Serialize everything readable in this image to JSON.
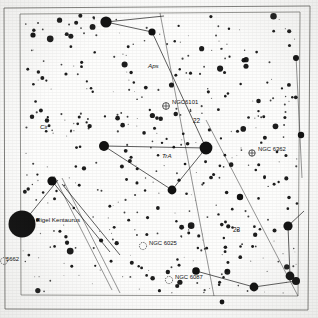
{
  "figure": {
    "kind": "star-chart",
    "background_color": "#fdfdfc",
    "ink_color": "#111111",
    "frame_color": "#5a5a55"
  },
  "frame": {
    "outer": {
      "x": 4,
      "y": 6,
      "w": 306,
      "h": 304
    },
    "inner": {
      "x": 20,
      "y": 12,
      "w": 280,
      "h": 284
    }
  },
  "constellation_labels": [
    {
      "name": "Aps",
      "text": "Aps",
      "x": 148,
      "y": 68,
      "size": 6.2,
      "style": "italic"
    },
    {
      "name": "TrA",
      "text": "TrA",
      "x": 162,
      "y": 158,
      "size": 6.2,
      "style": "italic"
    },
    {
      "name": "Cir",
      "text": "Cir",
      "x": 40,
      "y": 129,
      "size": 6.2,
      "style": "italic"
    }
  ],
  "deep_sky_objects": [
    {
      "name": "NGC6101",
      "label": "NGC6101",
      "symbol": "globular-cluster",
      "sx": 166,
      "sy": 106,
      "lx": 172,
      "ly": 104,
      "r": 3.4
    },
    {
      "name": "NGC6362",
      "label": "NGC 6362",
      "symbol": "globular-cluster",
      "sx": 252,
      "sy": 153,
      "lx": 258,
      "ly": 151,
      "r": 3.2
    },
    {
      "name": "NGC6025",
      "label": "NGC 6025",
      "symbol": "open-cluster",
      "sx": 143,
      "sy": 246,
      "lx": 149,
      "ly": 245,
      "r": 3.6
    },
    {
      "name": "NGC6087",
      "label": "NGC 6087",
      "symbol": "open-cluster",
      "sx": 169,
      "sy": 280,
      "lx": 175,
      "ly": 279,
      "r": 3.6
    },
    {
      "name": "NGC5662",
      "label": "5662",
      "symbol": "open-cluster",
      "sx": 4,
      "sy": 261,
      "lx": 6,
      "ly": 261,
      "r": 3.4
    }
  ],
  "named_stars": [
    {
      "name": "Rigel Kentaurus",
      "label": "Rigel Kentaurus",
      "x": 22,
      "y": 224,
      "r": 13.5,
      "lx": 36,
      "ly": 222
    }
  ],
  "ra_hour_labels": [
    {
      "name": "ra-22h",
      "text": "22",
      "x": 193,
      "y": 123,
      "size": 6.4
    },
    {
      "name": "ra-23h",
      "text": "23",
      "x": 233,
      "y": 232,
      "size": 6.4
    }
  ],
  "meridian_lines": [
    {
      "name": "meridian-21h",
      "x1": 296,
      "y1": 56,
      "x2": 302,
      "y2": 178
    },
    {
      "name": "meridian-22h",
      "x1": 160,
      "y1": 13,
      "x2": 214,
      "y2": 296
    },
    {
      "name": "meridian-23h",
      "x1": 206,
      "y1": 120,
      "x2": 298,
      "y2": 296
    },
    {
      "name": "meridian-24h",
      "x1": 54,
      "y1": 176,
      "x2": 112,
      "y2": 290
    },
    {
      "name": "meridian-24h-b",
      "x1": 62,
      "y1": 178,
      "x2": 120,
      "y2": 293
    }
  ],
  "constellation_lines": [
    {
      "name": "apus-line-1",
      "points": "106,22 164,16"
    },
    {
      "name": "apus-line-2",
      "points": "106,22 152,32"
    },
    {
      "name": "apus-line-3",
      "points": "152,32 206,148"
    },
    {
      "name": "tra-line-1",
      "points": "206,148 104,146"
    },
    {
      "name": "tra-line-2",
      "points": "104,146 172,190"
    },
    {
      "name": "tra-line-3",
      "points": "172,190 206,148"
    },
    {
      "name": "ara-line-1",
      "points": "254,287 296,281"
    },
    {
      "name": "ara-line-2",
      "points": "296,281 290,276"
    },
    {
      "name": "ara-line-3",
      "points": "290,276 288,226"
    },
    {
      "name": "ara-line-4",
      "points": "288,226 304,211"
    },
    {
      "name": "pav-line-1",
      "points": "254,287 196,271"
    },
    {
      "name": "cir-line-1",
      "points": "52,181 110,252"
    },
    {
      "name": "cir-line-2",
      "points": "62,184 120,255"
    },
    {
      "name": "cen-line-1",
      "points": "22,224 58,180"
    }
  ],
  "bright_stars": [
    {
      "x": 106,
      "y": 22,
      "r": 5.6
    },
    {
      "x": 152,
      "y": 32,
      "r": 3.6
    },
    {
      "x": 206,
      "y": 148,
      "r": 6.4
    },
    {
      "x": 104,
      "y": 146,
      "r": 5.0
    },
    {
      "x": 172,
      "y": 190,
      "r": 4.4
    },
    {
      "x": 52,
      "y": 181,
      "r": 4.6
    },
    {
      "x": 296,
      "y": 58,
      "r": 3.0
    },
    {
      "x": 301,
      "y": 135,
      "r": 3.2
    },
    {
      "x": 288,
      "y": 226,
      "r": 4.6
    },
    {
      "x": 290,
      "y": 276,
      "r": 4.4
    },
    {
      "x": 296,
      "y": 281,
      "r": 4.0
    },
    {
      "x": 254,
      "y": 287,
      "r": 4.4
    },
    {
      "x": 196,
      "y": 271,
      "r": 3.8
    },
    {
      "x": 240,
      "y": 197,
      "r": 3.2
    },
    {
      "x": 33,
      "y": 35,
      "r": 2.6
    },
    {
      "x": 222,
      "y": 302,
      "r": 2.4
    }
  ],
  "field_star_seed": 20240917,
  "field_star_count": 430
}
